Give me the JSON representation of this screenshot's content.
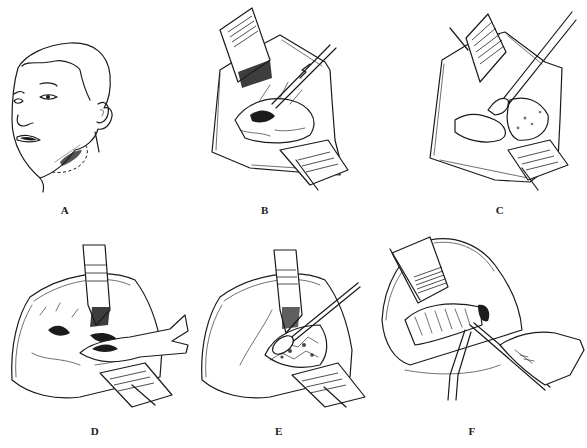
{
  "figure": {
    "type": "surgical procedure illustration",
    "panel_count": 6,
    "layout": "3 columns x 2 rows",
    "ink_color": "#1a1a1a",
    "background": "#ffffff"
  },
  "panels": [
    {
      "label": "A",
      "depicts": "patient head turned, submandibular incision line (dashed) below jaw"
    },
    {
      "label": "B",
      "depicts": "exposed wound with retractors, forceps grasping tissue"
    },
    {
      "label": "C",
      "depicts": "wound with retractors, instrument dissecting gland"
    },
    {
      "label": "D",
      "depicts": "retracted wound, gloved hand with clamp in cavity"
    },
    {
      "label": "E",
      "depicts": "retracted wound, swab on stick packing cavity"
    },
    {
      "label": "F",
      "depicts": "retracted wound, hand placing drain with forceps"
    }
  ]
}
